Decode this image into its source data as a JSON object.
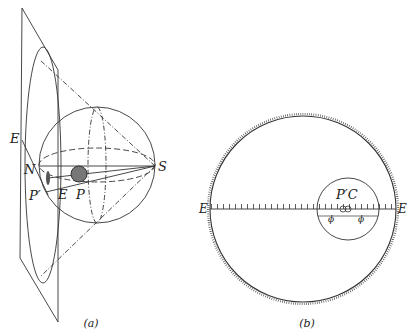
{
  "figure_a": {
    "caption": "(a)",
    "labels": {
      "E_top": "E",
      "N": "N",
      "S": "S",
      "P_prime": "P′",
      "E_bottom": "E",
      "P": "P"
    }
  },
  "figure_b": {
    "caption": "(b)",
    "labels": {
      "E_left": "E",
      "E_right": "E",
      "P_prime_C": "P′C",
      "phi_left": "ϕ",
      "phi_right": "ϕ"
    }
  },
  "colors": {
    "ink": "#222222",
    "background": "#ffffff"
  }
}
